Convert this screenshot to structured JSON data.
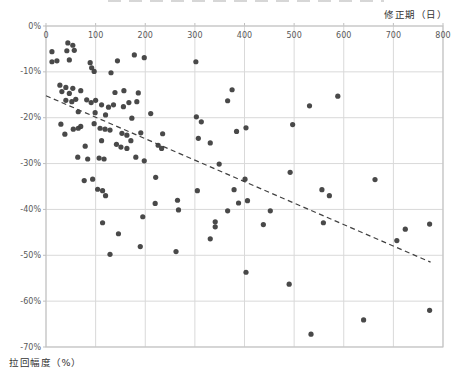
{
  "axes": {
    "x_title": "修正期（日）",
    "y_title": "拉回幅度（%）"
  },
  "chart_data": {
    "type": "scatter",
    "title": "",
    "xlabel": "修正期（日）",
    "ylabel": "拉回幅度（%）",
    "xlim": [
      0,
      800
    ],
    "ylim": [
      -70,
      0
    ],
    "x_tick_step": 100,
    "y_tick_step": 10,
    "x_tick_labels": [
      "0",
      "100",
      "200",
      "300",
      "400",
      "500",
      "600",
      "700",
      "800"
    ],
    "y_tick_labels": [
      "0%",
      "-10%",
      "-20%",
      "-30%",
      "-40%",
      "-50%",
      "-60%",
      "-70%"
    ],
    "grid": true,
    "legend": "none",
    "colors": {
      "point": "#3f3f3f",
      "trend": "#404040",
      "grid": "#d9d9d9",
      "border": "#bfbfbf",
      "tick_label": "#595959",
      "axis_title": "#333333"
    },
    "trendline": {
      "style": "dashed",
      "x1": 0,
      "y1": -15.2,
      "x2": 775,
      "y2": -51.5
    },
    "points": [
      [
        12,
        -5.6
      ],
      [
        44,
        -3.7
      ],
      [
        54,
        -4.2
      ],
      [
        42,
        -5.4
      ],
      [
        57,
        -5.3
      ],
      [
        12,
        -7.8
      ],
      [
        22,
        -7.6
      ],
      [
        47,
        -7.4
      ],
      [
        89,
        -8.0
      ],
      [
        92,
        -9.1
      ],
      [
        144,
        -7.6
      ],
      [
        178,
        -6.3
      ],
      [
        198,
        -6.9
      ],
      [
        97,
        -9.9
      ],
      [
        131,
        -10.2
      ],
      [
        302,
        -7.8
      ],
      [
        28,
        -12.9
      ],
      [
        40,
        -13.4
      ],
      [
        54,
        -13.6
      ],
      [
        32,
        -14.3
      ],
      [
        47,
        -14.7
      ],
      [
        70,
        -14.1
      ],
      [
        139,
        -14.5
      ],
      [
        157,
        -14.1
      ],
      [
        186,
        -14.6
      ],
      [
        375,
        -13.9
      ],
      [
        40,
        -16.2
      ],
      [
        52,
        -16.5
      ],
      [
        60,
        -16.0
      ],
      [
        82,
        -16.1
      ],
      [
        91,
        -16.7
      ],
      [
        100,
        -16.2
      ],
      [
        112,
        -17.2
      ],
      [
        126,
        -17.7
      ],
      [
        136,
        -17.2
      ],
      [
        156,
        -17.6
      ],
      [
        167,
        -16.7
      ],
      [
        183,
        -16.5
      ],
      [
        531,
        -17.4
      ],
      [
        588,
        -15.3
      ],
      [
        366,
        -16.3
      ],
      [
        65,
        -18.7
      ],
      [
        99,
        -18.9
      ],
      [
        120,
        -19.4
      ],
      [
        173,
        -20.1
      ],
      [
        211,
        -19.1
      ],
      [
        97,
        -21.3
      ],
      [
        303,
        -19.8
      ],
      [
        313,
        -20.9
      ],
      [
        497,
        -21.5
      ],
      [
        30,
        -21.4
      ],
      [
        70,
        -21.9
      ],
      [
        55,
        -22.5
      ],
      [
        65,
        -22.3
      ],
      [
        109,
        -22.3
      ],
      [
        119,
        -22.5
      ],
      [
        129,
        -22.7
      ],
      [
        153,
        -23.4
      ],
      [
        163,
        -23.8
      ],
      [
        191,
        -23.3
      ],
      [
        38,
        -23.6
      ],
      [
        235,
        -23.5
      ],
      [
        384,
        -23.0
      ],
      [
        403,
        -22.2
      ],
      [
        307,
        -24.5
      ],
      [
        112,
        -25.0
      ],
      [
        142,
        -25.8
      ],
      [
        171,
        -25.0
      ],
      [
        151,
        -26.4
      ],
      [
        163,
        -26.7
      ],
      [
        226,
        -26.0
      ],
      [
        233,
        -26.7
      ],
      [
        79,
        -26.2
      ],
      [
        331,
        -25.5
      ],
      [
        64,
        -28.6
      ],
      [
        84,
        -29.0
      ],
      [
        107,
        -28.8
      ],
      [
        117,
        -29.0
      ],
      [
        181,
        -28.6
      ],
      [
        198,
        -29.4
      ],
      [
        349,
        -30.1
      ],
      [
        77,
        -33.7
      ],
      [
        94,
        -33.4
      ],
      [
        104,
        -35.6
      ],
      [
        114,
        -35.9
      ],
      [
        221,
        -33.0
      ],
      [
        305,
        -35.9
      ],
      [
        401,
        -33.4
      ],
      [
        492,
        -31.9
      ],
      [
        556,
        -35.7
      ],
      [
        571,
        -37.0
      ],
      [
        663,
        -33.5
      ],
      [
        379,
        -35.7
      ],
      [
        120,
        -37.0
      ],
      [
        220,
        -38.7
      ],
      [
        265,
        -38.0
      ],
      [
        267,
        -40.1
      ],
      [
        195,
        -41.6
      ],
      [
        114,
        -42.9
      ],
      [
        146,
        -45.3
      ],
      [
        388,
        -38.6
      ],
      [
        406,
        -38.1
      ],
      [
        366,
        -40.3
      ],
      [
        452,
        -40.3
      ],
      [
        438,
        -43.3
      ],
      [
        341,
        -42.7
      ],
      [
        341,
        -43.8
      ],
      [
        331,
        -46.4
      ],
      [
        559,
        -42.9
      ],
      [
        707,
        -46.8
      ],
      [
        724,
        -44.3
      ],
      [
        773,
        -43.2
      ],
      [
        190,
        -48.1
      ],
      [
        129,
        -49.8
      ],
      [
        262,
        -49.2
      ],
      [
        403,
        -53.7
      ],
      [
        490,
        -56.3
      ],
      [
        534,
        -67.2
      ],
      [
        640,
        -64.1
      ],
      [
        773,
        -62.0
      ]
    ]
  }
}
